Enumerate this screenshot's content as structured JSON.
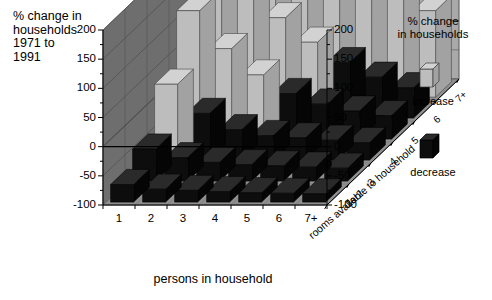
{
  "corner_title": "% change in\nhouseholds\n1971 to\n1991",
  "legend": {
    "title": "% change\nin households",
    "increase_label": "increase",
    "decrease_label": "decrease",
    "increase_color": "#b8b8b8",
    "decrease_color": "#111111"
  },
  "axes": {
    "x_title": "persons in household",
    "z_title": "rooms available to household",
    "y_ticks_left": [
      "200",
      "150",
      "100",
      "50",
      "0",
      "-50",
      "-100"
    ],
    "y_ticks_right": [
      "200",
      "150",
      "100",
      "50",
      "0",
      "-50",
      "-100"
    ],
    "x_ticks": [
      "1",
      "2",
      "3",
      "4",
      "5",
      "6",
      "7+"
    ],
    "z_ticks": [
      "1or2",
      "3",
      "4",
      "5",
      "6",
      "7+"
    ]
  },
  "palette": {
    "back_wall": "#a9a9a9",
    "left_wall": "#6e6e6e",
    "floor": "#8f8f8f",
    "grid_line": "#5a5a5a",
    "bar_increase_top": "#d2d2d2",
    "bar_increase_front": "#bdbdbd",
    "bar_increase_side": "#a2a2a2",
    "bar_decrease_top": "#2a2a2a",
    "bar_decrease_front": "#0d0d0d",
    "bar_decrease_side": "#050505",
    "outline": "#3a3a3a"
  },
  "chart_data": {
    "type": "bar",
    "title": "% change in households 1971 to 1991",
    "xlabel": "persons in household",
    "zlabel": "rooms available to household",
    "ylabel": "% change in households",
    "ylim": [
      -100,
      200
    ],
    "grid": true,
    "legend_position": "right",
    "categories_x": [
      "1",
      "2",
      "3",
      "4",
      "5",
      "6",
      "7+"
    ],
    "categories_z": [
      "1or2",
      "3",
      "4",
      "5",
      "6",
      "7+"
    ],
    "series": [
      {
        "name": "1or2",
        "values": [
          -70,
          -78,
          -80,
          -82,
          -84,
          -85,
          -86
        ]
      },
      {
        "name": "3",
        "values": [
          -45,
          -60,
          -68,
          -72,
          -74,
          -76,
          -78
        ]
      },
      {
        "name": "4",
        "values": [
          30,
          -20,
          -48,
          -58,
          -62,
          -66,
          -70
        ]
      },
      {
        "name": "5",
        "values": [
          120,
          55,
          10,
          -22,
          -40,
          -52,
          -60
        ]
      },
      {
        "name": "6",
        "values": [
          165,
          118,
          72,
          30,
          -5,
          -30,
          -48
        ]
      },
      {
        "name": "7+",
        "values": [
          195,
          178,
          150,
          118,
          148,
          100,
          48
        ]
      }
    ]
  }
}
